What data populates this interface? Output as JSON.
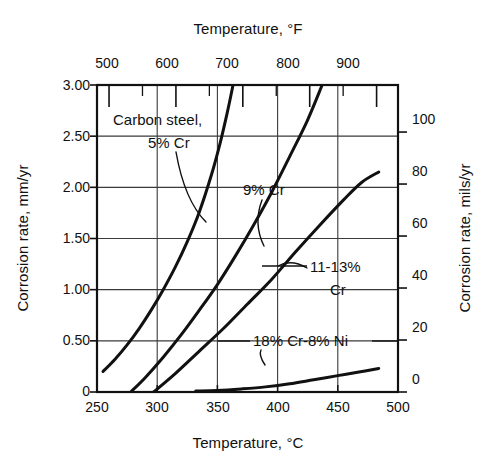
{
  "chart_data": {
    "type": "line",
    "title": "",
    "xlabel": "Temperature, °C",
    "ylabel": "Corrosion rate, mm/yr",
    "x2label": "Temperature, °F",
    "y2label": "Corrosion rate, mils/yr",
    "xlim": [
      250,
      500
    ],
    "ylim": [
      0,
      3.0
    ],
    "x2lim": [
      482,
      932
    ],
    "y2lim": [
      0,
      118.1
    ],
    "xticks": [
      250,
      300,
      350,
      400,
      450,
      500
    ],
    "xtick_labels": [
      "250",
      "300",
      "350",
      "400",
      "450",
      "500"
    ],
    "yticks": [
      0,
      0.5,
      1.0,
      1.5,
      2.0,
      2.5,
      3.0
    ],
    "ytick_labels": [
      "0",
      "0.50",
      "1.00",
      "1.50",
      "2.00",
      "2.50",
      "3.00"
    ],
    "x2ticks": [
      500,
      550,
      600,
      650,
      700,
      750,
      800,
      850,
      900
    ],
    "x2tick_labels": [
      "500",
      "",
      "600",
      "",
      "700",
      "",
      "800",
      "",
      "900"
    ],
    "y2ticks": [
      0,
      20,
      40,
      60,
      80,
      100
    ],
    "y2tick_labels": [
      "0",
      "20",
      "40",
      "60",
      "80",
      "100"
    ],
    "grid": true,
    "grid_axes": "both",
    "legend": "inline-annotations",
    "line_color": "#111111",
    "grid_color": "#3a3a3a",
    "frame_color": "#111111",
    "background": "#ffffff",
    "series": [
      {
        "name": "Carbon steel, 5% Cr",
        "label": "Carbon steel,\n5% Cr",
        "points": [
          [
            255,
            0.2
          ],
          [
            265,
            0.32
          ],
          [
            275,
            0.46
          ],
          [
            285,
            0.62
          ],
          [
            295,
            0.8
          ],
          [
            305,
            1.0
          ],
          [
            315,
            1.22
          ],
          [
            325,
            1.47
          ],
          [
            335,
            1.76
          ],
          [
            345,
            2.12
          ],
          [
            352,
            2.42
          ],
          [
            358,
            2.72
          ],
          [
            363,
            3.0
          ]
        ]
      },
      {
        "name": "9% Cr",
        "label": "9% Cr",
        "points": [
          [
            278,
            0.0
          ],
          [
            290,
            0.14
          ],
          [
            305,
            0.34
          ],
          [
            320,
            0.56
          ],
          [
            335,
            0.8
          ],
          [
            350,
            1.05
          ],
          [
            365,
            1.33
          ],
          [
            380,
            1.63
          ],
          [
            395,
            1.95
          ],
          [
            410,
            2.3
          ],
          [
            425,
            2.66
          ],
          [
            437,
            3.0
          ]
        ]
      },
      {
        "name": "11-13% Cr",
        "label": "11-13%\nCr",
        "points": [
          [
            297,
            0.0
          ],
          [
            315,
            0.18
          ],
          [
            335,
            0.4
          ],
          [
            355,
            0.62
          ],
          [
            375,
            0.86
          ],
          [
            395,
            1.1
          ],
          [
            415,
            1.37
          ],
          [
            435,
            1.63
          ],
          [
            455,
            1.88
          ],
          [
            470,
            2.05
          ],
          [
            484,
            2.15
          ]
        ]
      },
      {
        "name": "18% Cr-8% Ni",
        "label": "18% Cr-8% Ni",
        "points": [
          [
            332,
            0.01
          ],
          [
            350,
            0.015
          ],
          [
            370,
            0.03
          ],
          [
            390,
            0.05
          ],
          [
            410,
            0.08
          ],
          [
            430,
            0.12
          ],
          [
            450,
            0.16
          ],
          [
            470,
            0.2
          ],
          [
            484,
            0.23
          ]
        ]
      }
    ],
    "annotations": [
      {
        "name": "carbon-steel-label",
        "text_line1": "Carbon steel,",
        "text_line2": "5% Cr"
      },
      {
        "name": "nine-cr-label",
        "text_line1": "9% Cr",
        "text_line2": ""
      },
      {
        "name": "eleven-thirteen-cr-label",
        "text_line1": "11-13%",
        "text_line2": "Cr"
      },
      {
        "name": "eighteen-cr-eight-ni-label",
        "text_line1": "18% Cr-8% Ni",
        "text_line2": ""
      }
    ]
  },
  "axes": {
    "top_title": "Temperature, °F",
    "bottom_title": "Temperature, °C",
    "left_title": "Corrosion rate, mm/yr",
    "right_title": "Corrosion rate, mils/yr"
  },
  "labels": {
    "top_ticks": [
      "500",
      "600",
      "700",
      "800",
      "900"
    ],
    "bottom_ticks": [
      "250",
      "300",
      "350",
      "400",
      "450",
      "500"
    ],
    "left_ticks": [
      "3.00",
      "2.50",
      "2.00",
      "1.50",
      "1.00",
      "0.50",
      "0"
    ],
    "right_ticks": [
      "100",
      "80",
      "60",
      "40",
      "20",
      "0"
    ],
    "series": {
      "carbon_steel_l1": "Carbon steel,",
      "carbon_steel_l2": "5% Cr",
      "nine_cr": "9% Cr",
      "eleven_thirteen_l1": "11-13%",
      "eleven_thirteen_l2": "Cr",
      "eighteen_eight": "18% Cr-8% Ni"
    }
  }
}
